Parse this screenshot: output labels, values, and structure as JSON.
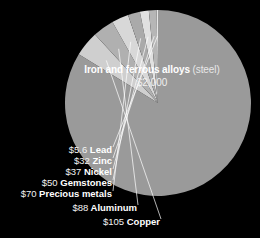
{
  "background_color": "#000000",
  "chart_data": {
    "type": "pie",
    "title": "",
    "subtitle": "",
    "xlabel": "",
    "ylabel": "",
    "units": "USD",
    "legend_position": "none",
    "grid": false,
    "center": {
      "x": 158,
      "y": 103
    },
    "radius": 93,
    "start_angle_deg": -90,
    "direction": "counterclockwise",
    "total": 2382.6,
    "categories": [
      "Iron and ferrous alloys (steel)",
      "Copper",
      "Aluminum",
      "Precious metals",
      "Gemstones",
      "Nickel",
      "Zinc",
      "Lead"
    ],
    "values": [
      2000,
      105,
      88,
      70,
      50,
      37,
      32,
      5.6
    ],
    "slices": [
      {
        "name": "Iron and ferrous alloys",
        "qualifier": "(steel)",
        "value": 2000,
        "value_label": "$2,000",
        "color": "#9a9a9a",
        "label_position": "inside"
      },
      {
        "name": "Copper",
        "qualifier": "",
        "value": 105,
        "value_label": "$105",
        "color": "#cfcfcf",
        "label_position": "callout"
      },
      {
        "name": "Aluminum",
        "qualifier": "",
        "value": 88,
        "value_label": "$88",
        "color": "#b0b0b0",
        "label_position": "callout"
      },
      {
        "name": "Precious metals",
        "qualifier": "",
        "value": 70,
        "value_label": "$70",
        "color": "#d8d8d8",
        "label_position": "callout"
      },
      {
        "name": "Gemstones",
        "qualifier": "",
        "value": 50,
        "value_label": "$50",
        "color": "#aaaaaa",
        "label_position": "callout"
      },
      {
        "name": "Nickel",
        "qualifier": "",
        "value": 37,
        "value_label": "$37",
        "color": "#e0e0e0",
        "label_position": "callout"
      },
      {
        "name": "Zinc",
        "qualifier": "",
        "value": 32,
        "value_label": "$32",
        "color": "#b6b6b6",
        "label_position": "callout"
      },
      {
        "name": "Lead",
        "qualifier": "",
        "value": 5.6,
        "value_label": "$5.6",
        "color": "#e6e6e6",
        "label_position": "callout"
      }
    ]
  },
  "main_label": {
    "name": "Iron and ferrous alloys",
    "qualifier": "(steel)",
    "value_label": "$2,000"
  },
  "callouts": [
    {
      "amount": "$5.6",
      "name": "Lead",
      "x": 112,
      "y": 149
    },
    {
      "amount": "$32",
      "name": "Zinc",
      "x": 112,
      "y": 160
    },
    {
      "amount": "$37",
      "name": "Nickel",
      "x": 112,
      "y": 171
    },
    {
      "amount": "$50",
      "name": "Gemstones",
      "x": 112,
      "y": 182
    },
    {
      "amount": "$70",
      "name": "Precious metals",
      "x": 112,
      "y": 193
    },
    {
      "amount": "$88",
      "name": "Aluminum",
      "x": 137,
      "y": 207
    },
    {
      "amount": "$105",
      "name": "Copper",
      "x": 160,
      "y": 221
    }
  ]
}
